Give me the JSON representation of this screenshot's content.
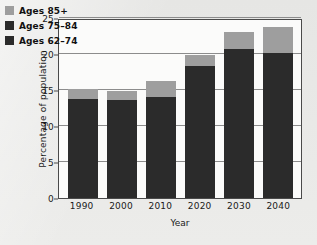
{
  "chart_data": {
    "type": "bar",
    "stacked": true,
    "title": "",
    "xlabel": "Year",
    "ylabel": "Percentage of population",
    "categories": [
      "1990",
      "2000",
      "2010",
      "2020",
      "2030",
      "2040"
    ],
    "ylim": [
      0,
      25
    ],
    "yticks": [
      0,
      5,
      10,
      15,
      20,
      25
    ],
    "ytick_labels": [
      "0",
      "5",
      "10",
      "15",
      "20",
      "25"
    ],
    "grid": true,
    "legend_position": "top-left",
    "series": [
      {
        "name": "Ages 62–74",
        "color": "#2b2b2b",
        "values": [
          9.6,
          9.4,
          9.9,
          13.4,
          14.8,
          13.9
        ]
      },
      {
        "name": "Ages 75–84",
        "color": "#2b2b2b",
        "values": [
          4.2,
          4.2,
          4.2,
          5.0,
          5.9,
          6.3
        ]
      },
      {
        "name": "Ages 85+",
        "color": "#9e9e9e",
        "values": [
          1.3,
          1.3,
          2.1,
          1.4,
          2.3,
          3.5
        ]
      }
    ],
    "totals": [
      15.1,
      14.9,
      16.2,
      19.8,
      23.0,
      23.7
    ],
    "dark_segment_totals": [
      13.8,
      13.6,
      14.1,
      18.4,
      20.7,
      20.2
    ]
  },
  "legend": {
    "items": [
      {
        "label": "Ages 85+",
        "color": "#9e9e9e"
      },
      {
        "label": "Ages 75–84",
        "color": "#2b2b2b"
      },
      {
        "label": "Ages 62–74",
        "color": "#2b2b2b"
      }
    ]
  },
  "axes": {
    "y_title": "Percentage of population",
    "x_title": "Year"
  },
  "colors": {
    "background": "#e9e9e7",
    "plot_background": "#fbfbfa",
    "axis": "#4a4a4a",
    "gridline": "#8c8c8c",
    "dark_bar": "#2b2b2b",
    "light_bar": "#9e9e9e"
  }
}
